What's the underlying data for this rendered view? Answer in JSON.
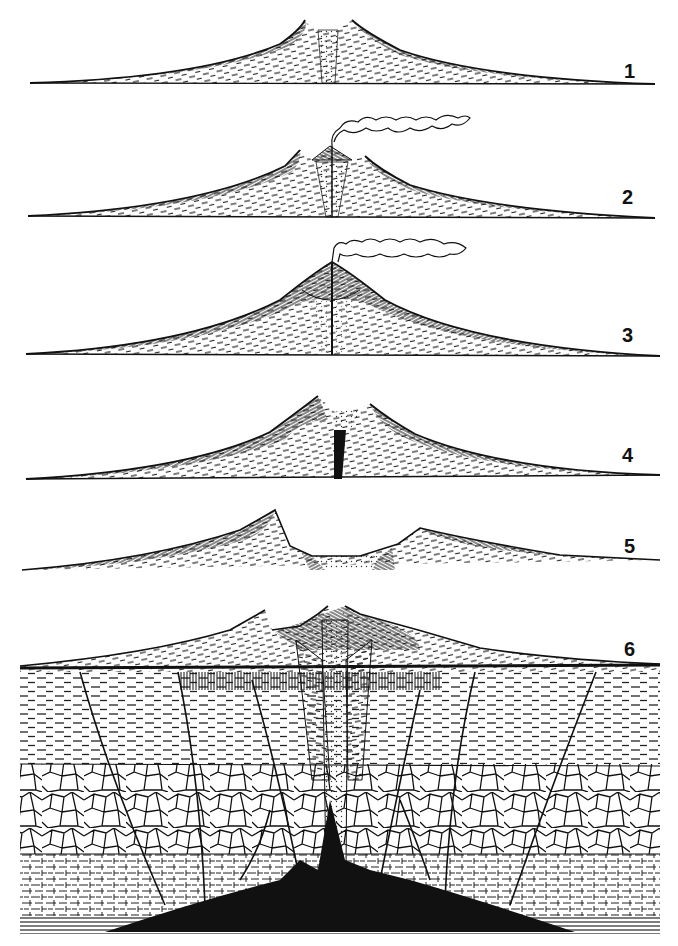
{
  "diagram": {
    "type": "geological cross-section series",
    "stages": [
      {
        "label": "1",
        "baseline_y": 83,
        "peak_y": 18,
        "description": "cone with central vent plug"
      },
      {
        "label": "2",
        "baseline_y": 217,
        "peak_y": 150,
        "description": "cone with small inner cone and smoke plume"
      },
      {
        "label": "3",
        "baseline_y": 355,
        "peak_y": 262,
        "description": "large unified cone with smoke plume"
      },
      {
        "label": "4",
        "baseline_y": 479,
        "peak_y": 398,
        "description": "cone with breached summit crater"
      },
      {
        "label": "5",
        "baseline_y": 563,
        "peak_y": 510,
        "description": "collapsed caldera"
      },
      {
        "label": "6",
        "baseline_y": 665,
        "peak_y": 610,
        "description": "caldera with underlying strata, faults and magma chamber"
      }
    ],
    "colors": {
      "ink": "#111111",
      "paper": "#ffffff"
    }
  }
}
